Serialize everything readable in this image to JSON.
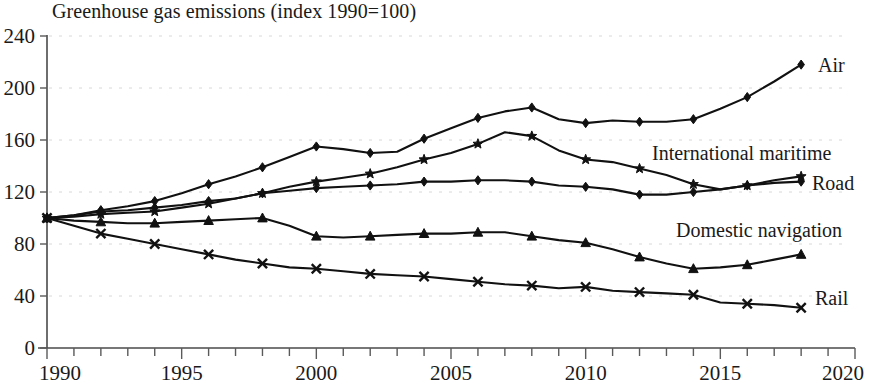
{
  "chart_data": {
    "type": "line",
    "title": "Greenhouse gas emissions (index 1990=100)",
    "xlabel": "",
    "ylabel": "",
    "xlim": [
      1990,
      2020
    ],
    "ylim": [
      0,
      240
    ],
    "yticks": [
      0,
      40,
      80,
      120,
      160,
      200,
      240
    ],
    "xticks": [
      1990,
      1995,
      2000,
      2005,
      2010,
      2015,
      2020
    ],
    "x_minor_tick_step": 1,
    "grid": true,
    "grid_axis": "y",
    "legend_position": "right-inline",
    "x": [
      1990,
      1991,
      1992,
      1993,
      1994,
      1995,
      1996,
      1997,
      1998,
      1999,
      2000,
      2001,
      2002,
      2003,
      2004,
      2005,
      2006,
      2007,
      2008,
      2009,
      2010,
      2011,
      2012,
      2013,
      2014,
      2015,
      2016,
      2017,
      2018
    ],
    "series": [
      {
        "name": "Air",
        "marker": "diamond",
        "label": "Air",
        "values": [
          100,
          102,
          106,
          109,
          113,
          119,
          126,
          132,
          139,
          147,
          155,
          153,
          150,
          151,
          161,
          169,
          177,
          182,
          185,
          176,
          173,
          175,
          174,
          174,
          176,
          184,
          193,
          205,
          218
        ]
      },
      {
        "name": "International maritime",
        "marker": "star",
        "label": "International maritime",
        "values": [
          100,
          101,
          103,
          104,
          105,
          108,
          111,
          115,
          119,
          124,
          128,
          131,
          134,
          139,
          145,
          150,
          157,
          166,
          163,
          152,
          145,
          143,
          138,
          133,
          126,
          122,
          125,
          129,
          132
        ]
      },
      {
        "name": "Road",
        "marker": "diamond",
        "label": "Road",
        "values": [
          100,
          102,
          105,
          106,
          108,
          110,
          113,
          115,
          119,
          121,
          123,
          124,
          125,
          126,
          128,
          128,
          129,
          129,
          128,
          125,
          124,
          122,
          118,
          118,
          120,
          122,
          125,
          127,
          128
        ]
      },
      {
        "name": "Domestic navigation",
        "marker": "triangle",
        "label": "Domestic navigation",
        "values": [
          100,
          98,
          97,
          96,
          96,
          97,
          98,
          99,
          100,
          94,
          86,
          85,
          86,
          87,
          88,
          88,
          89,
          89,
          86,
          83,
          81,
          76,
          70,
          65,
          61,
          62,
          64,
          68,
          72
        ]
      },
      {
        "name": "Rail",
        "marker": "x",
        "label": "Rail",
        "values": [
          100,
          94,
          88,
          84,
          80,
          76,
          72,
          68,
          65,
          62,
          61,
          59,
          57,
          56,
          55,
          53,
          51,
          49,
          48,
          46,
          47,
          44,
          43,
          42,
          41,
          35,
          34,
          33,
          31
        ]
      }
    ]
  },
  "axis": {
    "y_labels": [
      "240",
      "200",
      "160",
      "120",
      "80",
      "40",
      "0"
    ],
    "x_labels": [
      "1990",
      "1995",
      "2000",
      "2005",
      "2010",
      "2015",
      "2020"
    ]
  },
  "colors": {
    "line": "#111111",
    "axis": "#4a4a4a",
    "grid": "#d8d8d8",
    "text": "#1a1a1a",
    "background": "#ffffff"
  }
}
